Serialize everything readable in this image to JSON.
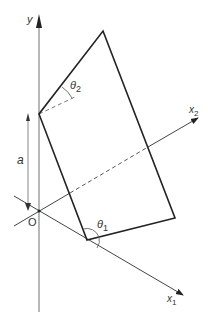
{
  "diagram": {
    "labels": {
      "y_axis": "y",
      "x1_axis": "x",
      "x1_sub": "1",
      "x2_axis": "x",
      "x2_sub": "2",
      "origin": "O",
      "offset": "a",
      "theta1": "θ",
      "theta1_sub": "1",
      "theta2": "θ",
      "theta2_sub": "2"
    },
    "colors": {
      "axis": "#888888",
      "shape": "#222222",
      "dashed": "#666666",
      "text": "#333333"
    }
  }
}
